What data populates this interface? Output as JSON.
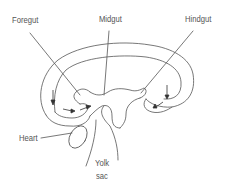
{
  "diagram": {
    "labels": {
      "foregut": "Foregut",
      "midgut": "Midgut",
      "hindgut": "Hindgut",
      "heart": "Heart",
      "yolk_line1": "Yolk",
      "yolk_line2": "sac"
    },
    "colors": {
      "stroke": "#555555",
      "text": "#555555",
      "background": "#ffffff"
    }
  }
}
